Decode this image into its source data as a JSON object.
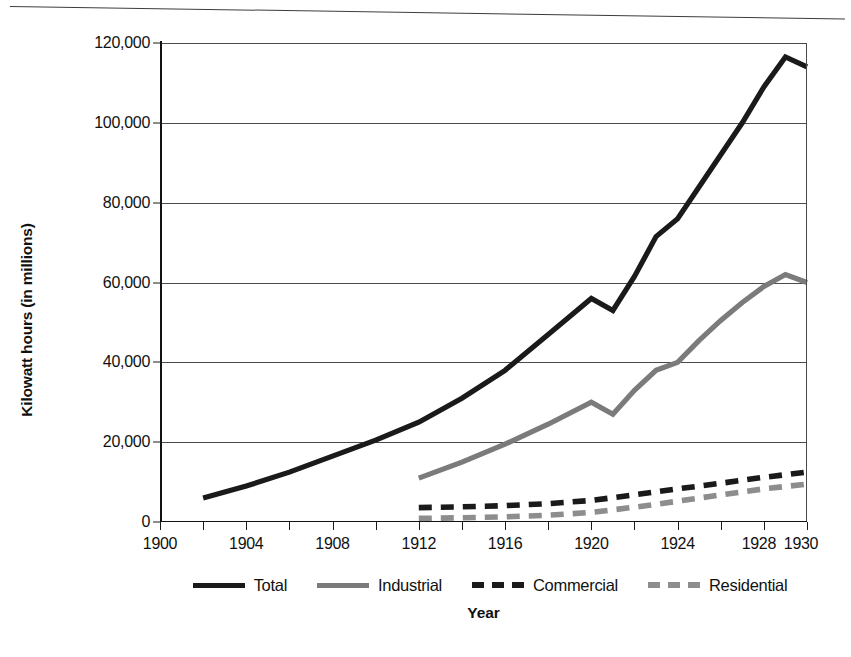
{
  "chart_data": {
    "type": "line",
    "title": "",
    "xlabel": "Year",
    "ylabel": "Kilowatt hours (in millions)",
    "xlim": [
      1900,
      1930
    ],
    "ylim": [
      0,
      120000
    ],
    "grid": true,
    "legend_position": "bottom",
    "x_tick_labels": [
      "1900",
      "1904",
      "1908",
      "1912",
      "1916",
      "1920",
      "1924",
      "1928",
      "1930"
    ],
    "x_tick_values": [
      1900,
      1904,
      1908,
      1912,
      1916,
      1920,
      1924,
      1928,
      1930
    ],
    "x_minor_tick_values": [
      1902,
      1906,
      1910,
      1914,
      1918,
      1922,
      1926
    ],
    "y_tick_labels": [
      "0",
      "20,000",
      "40,000",
      "60,000",
      "80,000",
      "100,000",
      "120,000"
    ],
    "y_tick_values": [
      0,
      20000,
      40000,
      60000,
      80000,
      100000,
      120000
    ],
    "series": [
      {
        "name": "Total",
        "style": "solid",
        "color": "#1a1a1a",
        "width": 5.2,
        "x": [
          1902,
          1904,
          1906,
          1908,
          1910,
          1912,
          1914,
          1916,
          1918,
          1920,
          1921,
          1922,
          1923,
          1924,
          1925,
          1926,
          1927,
          1928,
          1929,
          1930
        ],
        "values": [
          6000,
          9000,
          12500,
          16500,
          20500,
          25000,
          31000,
          38000,
          47000,
          56000,
          53000,
          61500,
          71500,
          76000,
          84000,
          92000,
          100000,
          109000,
          116500,
          114000
        ]
      },
      {
        "name": "Industrial",
        "style": "solid",
        "color": "#7b7b7b",
        "width": 5.2,
        "x": [
          1912,
          1914,
          1916,
          1918,
          1920,
          1921,
          1922,
          1923,
          1924,
          1925,
          1926,
          1927,
          1928,
          1929,
          1930
        ],
        "values": [
          11000,
          15000,
          19500,
          24500,
          30000,
          27000,
          33000,
          38000,
          40000,
          45500,
          50500,
          55000,
          59000,
          62000,
          60000
        ]
      },
      {
        "name": "Commercial",
        "style": "dashed",
        "color": "#1a1a1a",
        "width": 5.6,
        "x": [
          1912,
          1914,
          1916,
          1918,
          1920,
          1922,
          1924,
          1926,
          1928,
          1930
        ],
        "values": [
          3600,
          3800,
          4100,
          4600,
          5400,
          6800,
          8300,
          9700,
          11200,
          12500
        ]
      },
      {
        "name": "Residential",
        "style": "dashed",
        "color": "#8d8d8d",
        "width": 5.6,
        "x": [
          1912,
          1914,
          1916,
          1918,
          1920,
          1922,
          1924,
          1926,
          1928,
          1930
        ],
        "values": [
          900,
          1050,
          1300,
          1700,
          2400,
          3700,
          5200,
          6800,
          8300,
          9500
        ]
      }
    ]
  },
  "axis": {
    "y_title": "Kilowatt hours (in millions)",
    "x_title": "Year"
  },
  "legend": {
    "items": [
      {
        "label": "Total",
        "color": "#1a1a1a",
        "style": "solid"
      },
      {
        "label": "Industrial",
        "color": "#7b7b7b",
        "style": "solid"
      },
      {
        "label": "Commercial",
        "color": "#1a1a1a",
        "style": "dashed"
      },
      {
        "label": "Residential",
        "color": "#8d8d8d",
        "style": "dashed"
      }
    ]
  },
  "colors": {
    "ink": "#1a1a1a",
    "gray_series": "#7b7b7b",
    "grid": "#4a4a4a",
    "background": "#ffffff"
  }
}
